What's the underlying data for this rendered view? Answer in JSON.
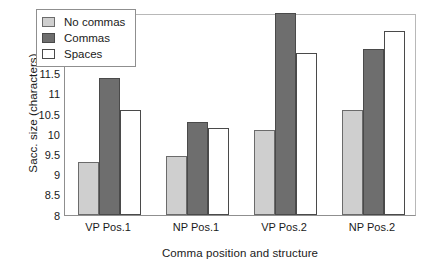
{
  "chart_data": {
    "type": "bar",
    "title": "",
    "xlabel": "Comma position and structure",
    "ylabel": "Sacc. size (characters)",
    "categories": [
      "VP Pos.1",
      "NP Pos.1",
      "VP Pos.2",
      "NP Pos.2"
    ],
    "series": [
      {
        "name": "No commas",
        "color": "#cfcfcf",
        "values": [
          9.3,
          9.45,
          10.1,
          10.6
        ]
      },
      {
        "name": "Commas",
        "color": "#6e6e6e",
        "values": [
          11.4,
          10.3,
          13.0,
          12.1
        ]
      },
      {
        "name": "Spaces",
        "color": "#ffffff",
        "values": [
          10.6,
          10.15,
          12.0,
          12.55
        ]
      }
    ],
    "ylim": [
      8,
      13
    ],
    "yticks": [
      "13",
      "12.5",
      "12",
      "11.5",
      "11",
      "10.5",
      "10",
      "9.5",
      "9",
      "8.5",
      "8"
    ],
    "ytick_values": [
      13,
      12.5,
      12,
      11.5,
      11,
      10.5,
      10,
      9.5,
      9,
      8.5,
      8
    ],
    "grid": false,
    "legend_position": "top-left",
    "legend_entries": [
      "No commas",
      "Commas",
      "Spaces"
    ]
  }
}
